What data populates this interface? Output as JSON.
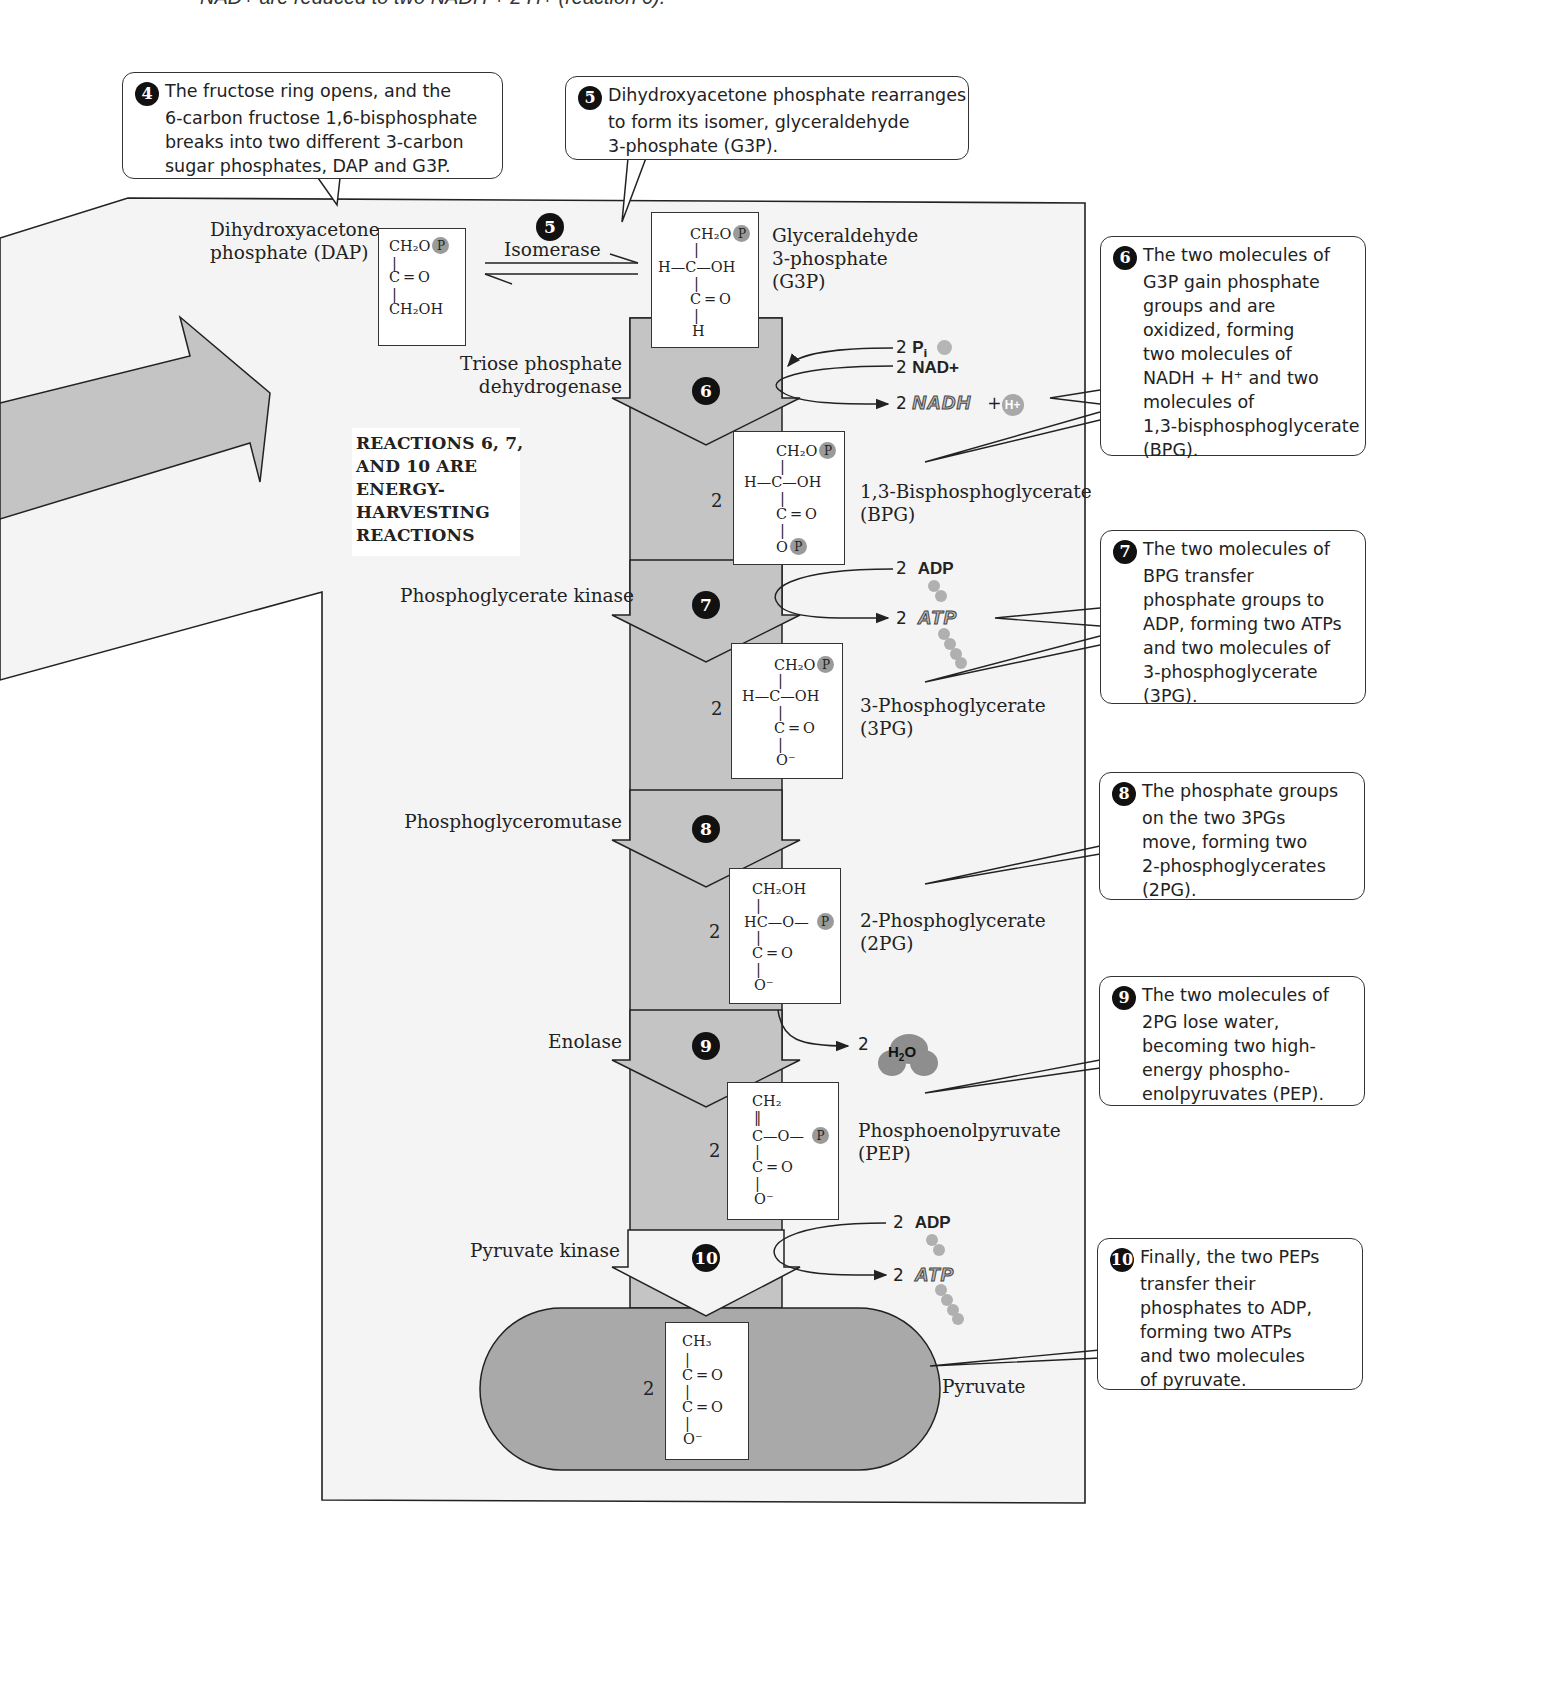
{
  "header_fragment": "NAD+ are reduced to two NADH + 2 H+ (reaction 6).",
  "callouts": {
    "c4": {
      "number": "4",
      "lines": [
        "The fructose ring opens, and the",
        "6-carbon fructose 1,6-bisphosphate",
        "breaks into two different 3-carbon",
        "sugar phosphates, DAP and G3P."
      ]
    },
    "c5": {
      "number": "5",
      "lines": [
        "Dihydroxyacetone phosphate rearranges",
        "to form its isomer, glyceraldehyde",
        "3-phosphate (G3P)."
      ]
    },
    "c6": {
      "number": "6",
      "lines": [
        "The two molecules of",
        "G3P gain phosphate",
        "groups and are",
        "oxidized, forming",
        "two molecules of",
        "NADH + H⁺ and two",
        "molecules of",
        "1,3-bisphosphoglycerate",
        "(BPG)."
      ]
    },
    "c7": {
      "number": "7",
      "lines": [
        "The two molecules of",
        "BPG transfer",
        "phosphate groups to",
        "ADP, forming two ATPs",
        "and two molecules of",
        "3-phosphoglycerate",
        "(3PG)."
      ]
    },
    "c8": {
      "number": "8",
      "lines": [
        "The phosphate groups",
        "on the two 3PGs",
        "move, forming two",
        "2-phosphoglycerates",
        "(2PG)."
      ]
    },
    "c9": {
      "number": "9",
      "lines": [
        "The two molecules of",
        "2PG lose water,",
        "becoming two high-",
        "energy phospho-",
        "enolpyruvates (PEP)."
      ]
    },
    "c10": {
      "number": "10",
      "lines": [
        "Finally, the two PEPs",
        "transfer their",
        "phosphates to ADP,",
        "forming two ATPs",
        "and two molecules",
        "of pyruvate."
      ]
    }
  },
  "compounds": {
    "dap": {
      "name_lines": [
        "Dihydroxyacetone",
        "phosphate (DAP)"
      ],
      "formula": [
        "CH₂O",
        "C = O",
        "CH₂OH"
      ]
    },
    "g3p": {
      "name_lines": [
        "Glyceraldehyde",
        "3-phosphate",
        "(G3P)"
      ],
      "formula": [
        "CH₂O",
        "H—C—OH",
        "C = O",
        "H"
      ]
    },
    "bpg": {
      "coefficient": "2",
      "name_lines": [
        "1,3-Bisphosphoglycerate",
        "(BPG)"
      ],
      "formula": [
        "CH₂O",
        "H—C—OH",
        "C = O",
        "O"
      ]
    },
    "pg3": {
      "coefficient": "2",
      "name_lines": [
        "3-Phosphoglycerate",
        "(3PG)"
      ],
      "formula": [
        "CH₂O",
        "H—C—OH",
        "C = O",
        "O⁻"
      ]
    },
    "pg2": {
      "coefficient": "2",
      "name_lines": [
        "2-Phosphoglycerate",
        "(2PG)"
      ],
      "formula": [
        "CH₂OH",
        "HC—O—",
        "C = O",
        "O⁻"
      ]
    },
    "pep": {
      "coefficient": "2",
      "name_lines": [
        "Phosphoenolpyruvate",
        "(PEP)"
      ],
      "formula": [
        "CH₂",
        "C—O—",
        "C = O",
        "O⁻"
      ]
    },
    "pyruvate": {
      "coefficient": "2",
      "name_lines": [
        "Pyruvate"
      ],
      "formula": [
        "CH₃",
        "C = O",
        "C = O",
        "O⁻"
      ]
    }
  },
  "phosphate_symbol": "P",
  "enzymes": {
    "isomerase": {
      "step": "5",
      "name": "Isomerase"
    },
    "tpdh": {
      "step": "6",
      "lines": [
        "Triose phosphate",
        "dehydrogenase"
      ]
    },
    "pgk": {
      "step": "7",
      "name": "Phosphoglycerate kinase"
    },
    "pgm": {
      "step": "8",
      "name": "Phosphoglyceromutase"
    },
    "enolase": {
      "step": "9",
      "name": "Enolase"
    },
    "pk": {
      "step": "10",
      "name": "Pyruvate kinase"
    }
  },
  "energy_note": [
    "REACTIONS 6, 7,",
    "AND 10 ARE",
    "ENERGY-",
    "HARVESTING",
    "REACTIONS"
  ],
  "cofactors": {
    "r6": {
      "pi_coef": "2",
      "pi": "P",
      "pi_sub": "i",
      "nad_coef": "2",
      "nad": "NAD+",
      "nadh_coef": "2",
      "nadh": "NADH",
      "plus": "+",
      "hplus": "H+"
    },
    "r7": {
      "adp_coef": "2",
      "adp": "ADP",
      "atp_coef": "2",
      "atp": "ATP"
    },
    "r9": {
      "water_coef": "2",
      "water_h": "H",
      "water_sub": "2",
      "water_o": "O"
    },
    "r10": {
      "adp_coef": "2",
      "adp": "ADP",
      "atp_coef": "2",
      "atp": "ATP"
    }
  },
  "colors": {
    "panel_bg": "#f4f4f4",
    "arrow_fill": "#c4c4c4",
    "pyruvate_fill": "#a9a9a9",
    "phosphate_dot": "#9a9a9a",
    "stroke": "#222222"
  }
}
